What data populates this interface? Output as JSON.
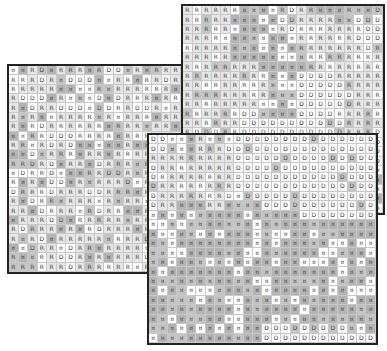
{
  "diagram": {
    "cell_size": 9.6,
    "symbols": [
      "R",
      "D",
      "G"
    ],
    "colors": {
      "border": "#222222",
      "grid_line": "#c8c8c8",
      "light": "#ffffff",
      "dark": "#a8a8a8"
    },
    "panels": [
      {
        "id": "left",
        "left": 7,
        "top": 64,
        "width": 176,
        "height": 210,
        "cols": 18,
        "rows": 22,
        "rows_text": [
          "GGRDGRRRGRDDGRGRRRDR",
          "RRRDRGDDDGGRRGRRDRRG",
          "RRRRRGGGGRGRRRRRRGGR",
          "RDDDGRGGGDGDRRRGRRRD",
          "RGDRRDDDGDDRRDDRGRRR",
          "RGRGGRRRRGRGRRRGRRDR",
          "RGRDRRRRRRGRRRGRRGRR",
          "GGRRDDDRRRRGRRRRRRRR",
          "RRGRDRDGGGGGRGGGRRDR",
          "GGDGRRRGRRGRRRRRDRRR",
          "RRDRDGRRGDRRRGRGRDRR",
          "GDRRDGGGRRDDRGRRGRRR",
          "RGRGDDGRGRRRDGRRRDRR",
          "DRRRDRRRDDRRRGRRRDRR",
          "RGDRRGRRRGRGRRGRRRRR",
          "RRGDRRRGRDRRGGRRGRRR",
          "GRRRDDGRRRRRGRRRRRDR",
          "RDRRRGRGRDRRRGRRRRRR",
          "RGRDGRRRRRGRRRDRRGRR",
          "GGDRRGDRRGRRRRGRRRRR",
          "RGGRRDDRGRGRRRDRRRGR",
          "RRRRRRDRRRRRRGRRRGRR"
        ]
      },
      {
        "id": "top-right",
        "left": 181,
        "top": 4,
        "width": 204,
        "height": 211,
        "cols": 21,
        "rows": 22,
        "rows_text": [
          "RRRRRRGGGGRDRRGGGRGGD",
          "RRRRRGGGGGDDRRRRGGDDD",
          "RRRRRGGGGGRDRRRRRRRDD",
          "RRRRGGGGGGGGRRRRRRDDD",
          "RRRRRGGGGGGGRRRRRRRDR",
          "RRRRRGGGGGGGGRRRRRRRR",
          "RRRRRRRRGGGGGRRRRRRRR",
          "RRRRRRRRRGGGDDDDRRRRR",
          "RRRRRRRRRGGGDDDDDRRRR",
          "RRRRRRRRRGGGDDDDDDRRR",
          "RRRRRRRRGGGGDDDDDDRRR",
          "RRRRRRDDGGGGDDDDRRRRR",
          "RRRRRRDDDDDDDDDDDRRRR",
          "RDDDRRDDDDDDDDDDDRRRD",
          "DDDDDRDDDDDDDDDDDDDDD",
          "DDDDDDDDDDDDDDDDDDDRD",
          "DDDDDDDDDDDDDDDDDDDDD",
          "DDDDDDDDDDDDDDDDDDDGG",
          "DDDDDDDDDDDDDDDDDDDGG",
          "DDDDDDDDDDDDDDDDDDGGG",
          "DDDDDDDDDDDDDDDDDDGGG",
          "DDDDDDDDDDDDDDDDDDGGG"
        ]
      },
      {
        "id": "front",
        "left": 147,
        "top": 133,
        "width": 231,
        "height": 212,
        "cols": 24,
        "rows": 22,
        "rows_text": [
          "DDGGGRGGGDDDDDDDDDDDDDDD",
          "DDGGGRRRDDDDDDDDDDDDDDDD",
          "RRRRRRRRRDDDDDDDDDDDDDDD",
          "DRRRRRRRRDDDDDDDDDDDDDDD",
          "DRRRRRRRRDDDDDDDDDDDDDDD",
          "DRRRRRRRRDDDDDDDDDDDDDDD",
          "DRRRRRRRDGDDDDDDDDDDDDDD",
          "DRRGGGRRGGGGDDDDDDDDDDDD",
          "GGGGGGGGGGGGGGGGDDDDDDDD",
          "GGGGGGGGGGGGGGGGGGGGGGGG",
          "GGGGGGGGGGGGGGGGGGGGGGGG",
          "GGGGGGGGGGGGGGGGGGGGGGGG",
          "GGGGGGGGGGGGGGGGGGGGGGGG",
          "GGGGGGGGGGGGGGGGGGGGGGGG",
          "GGGGGGGGGGGGGGGGGGGGGGGG",
          "GGGGGGGGGGGGGGGGGGGGGGGG",
          "GGGGGGGGGGGGGGGGGGGGGGGG",
          "GGGGGGGGGGGGGGGGGGGGGGGG",
          "GGGGGGGGGGGGGGGGGGGGGGGG",
          "GGGGGGGGGGGGGGGGGGGGGGGG",
          "GGGGGGGGGGGGDDDDDDDDDGGG",
          "GGGGGGGGGGGGDDDDDDDDDDDD"
        ]
      }
    ]
  }
}
